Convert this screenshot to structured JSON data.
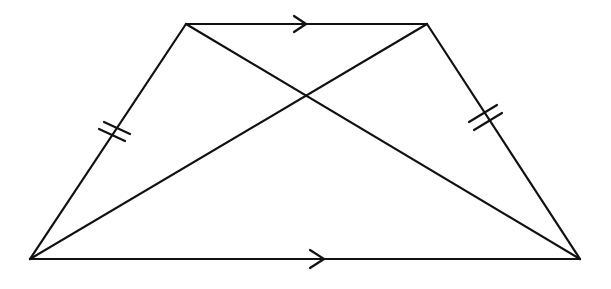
{
  "diagram": {
    "type": "isosceles-trapezoid-with-diagonals",
    "stroke_color": "#111111",
    "background": "#ffffff",
    "vertices": {
      "bottom_left": [
        30,
        259
      ],
      "top_left": [
        186,
        24
      ],
      "top_right": [
        427,
        24
      ],
      "bottom_right": [
        580,
        259
      ]
    },
    "edges": [
      {
        "name": "top-base",
        "from": "top_left",
        "to": "top_right",
        "marking": "parallel-arrow"
      },
      {
        "name": "bottom-base",
        "from": "bottom_left",
        "to": "bottom_right",
        "marking": "parallel-arrow"
      },
      {
        "name": "left-leg",
        "from": "bottom_left",
        "to": "top_left",
        "marking": "double-tick"
      },
      {
        "name": "right-leg",
        "from": "top_right",
        "to": "bottom_right",
        "marking": "double-tick"
      },
      {
        "name": "diagonal-1",
        "from": "top_left",
        "to": "bottom_right",
        "marking": "none"
      },
      {
        "name": "diagonal-2",
        "from": "top_right",
        "to": "bottom_left",
        "marking": "none"
      }
    ],
    "markings": {
      "parallel_arrows": 2,
      "congruence_ticks_per_leg": 2
    }
  }
}
